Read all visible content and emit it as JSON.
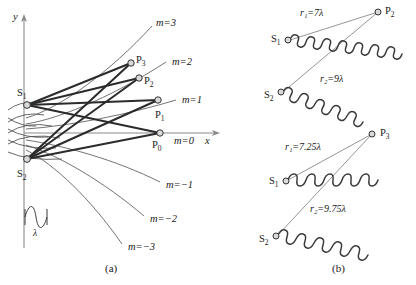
{
  "figure": {
    "panels": [
      {
        "id": "a",
        "label": "(a)"
      },
      {
        "id": "b",
        "label": "(b)"
      }
    ]
  },
  "panel_a": {
    "axes": {
      "x_label": "x",
      "y_label": "y"
    },
    "sources": [
      {
        "name": "S1",
        "label": "S",
        "subscript": "1"
      },
      {
        "name": "S2",
        "label": "S",
        "subscript": "2"
      }
    ],
    "points": [
      {
        "name": "P0",
        "label": "P",
        "subscript": "0"
      },
      {
        "name": "P1",
        "label": "P",
        "subscript": "1"
      },
      {
        "name": "P2",
        "label": "P",
        "subscript": "2"
      },
      {
        "name": "P3",
        "label": "P",
        "subscript": "3"
      }
    ],
    "order_labels": [
      {
        "name": "m3",
        "text": "m=3"
      },
      {
        "name": "m2",
        "text": "m=2"
      },
      {
        "name": "m1",
        "text": "m=1"
      },
      {
        "name": "m0",
        "text": "m=0"
      },
      {
        "name": "m-1",
        "text": "m=−1"
      },
      {
        "name": "m-2",
        "text": "m=−2"
      },
      {
        "name": "m-3",
        "text": "m=−3"
      }
    ],
    "scale_indicator": {
      "label": "λ"
    }
  },
  "panel_b": {
    "diagrams": [
      {
        "name": "constructive",
        "target_point": {
          "label": "P",
          "subscript": "2"
        },
        "sources": [
          {
            "label": "S",
            "subscript": "1"
          },
          {
            "label": "S",
            "subscript": "2"
          }
        ],
        "path_labels": [
          {
            "name": "r1",
            "text": "r₁=7λ",
            "symbol": "r",
            "subscript": "1",
            "value": "7λ"
          },
          {
            "name": "r2",
            "text": "r₂=9λ",
            "symbol": "r",
            "subscript": "2",
            "value": "9λ"
          }
        ]
      },
      {
        "name": "intermediate",
        "target_point": {
          "label": "P",
          "subscript": "3"
        },
        "sources": [
          {
            "label": "S",
            "subscript": "1"
          },
          {
            "label": "S",
            "subscript": "2"
          }
        ],
        "path_labels": [
          {
            "name": "r1",
            "text": "r₁=7.25λ",
            "symbol": "r",
            "subscript": "1",
            "value": "7.25λ"
          },
          {
            "name": "r2",
            "text": "r₂=9.75λ",
            "symbol": "r",
            "subscript": "2",
            "value": "9.75λ"
          }
        ]
      }
    ]
  },
  "colors": {
    "ray": "#2b2b2b",
    "wavefront": "#4d4d4d",
    "axis": "#8a8a8a",
    "node_fill": "#d9d9d9",
    "text": "#1a1a1a"
  }
}
